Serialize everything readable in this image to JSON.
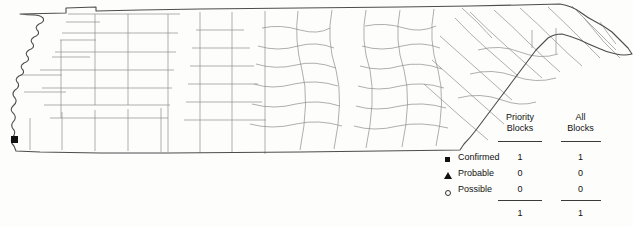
{
  "map": {
    "region_name": "Tennessee",
    "subdivision_type": "counties",
    "outline_color": "#555555",
    "county_border_color": "#8a8a8a",
    "background_color": "#fdfdfc",
    "markers": [
      {
        "symbol": "filled-square",
        "category": "Confirmed",
        "color": "#111111",
        "x": 14,
        "y": 139
      }
    ]
  },
  "legend": {
    "columns": [
      {
        "line1": "Priority",
        "line2": "Blocks"
      },
      {
        "line1": "All",
        "line2": "Blocks"
      }
    ],
    "rows": [
      {
        "symbol": "filled-square",
        "label": "Confirmed",
        "priority_blocks": "1",
        "all_blocks": "1"
      },
      {
        "symbol": "filled-triangle",
        "label": "Probable",
        "priority_blocks": "0",
        "all_blocks": "0"
      },
      {
        "symbol": "open-circle",
        "label": "Possible",
        "priority_blocks": "0",
        "all_blocks": "0"
      }
    ],
    "totals": {
      "priority_blocks": "1",
      "all_blocks": "1"
    }
  }
}
